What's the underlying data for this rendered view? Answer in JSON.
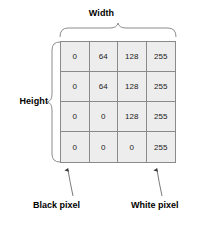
{
  "diagram": {
    "width_label": "Width",
    "height_label": "Height",
    "grid": {
      "rows": 4,
      "cols": 4,
      "values": [
        [
          "0",
          "64",
          "128",
          "255"
        ],
        [
          "0",
          "64",
          "128",
          "255"
        ],
        [
          "0",
          "0",
          "128",
          "255"
        ],
        [
          "0",
          "0",
          "0",
          "255"
        ]
      ]
    },
    "callouts": {
      "black_pixel": "Black pixel",
      "white_pixel": "White pixel"
    },
    "colors": {
      "cell_fill": "#ededed",
      "cell_border": "#8a8a8a",
      "text": "#000000",
      "brace": "#8c8c8c",
      "arrow": "#555555"
    }
  }
}
